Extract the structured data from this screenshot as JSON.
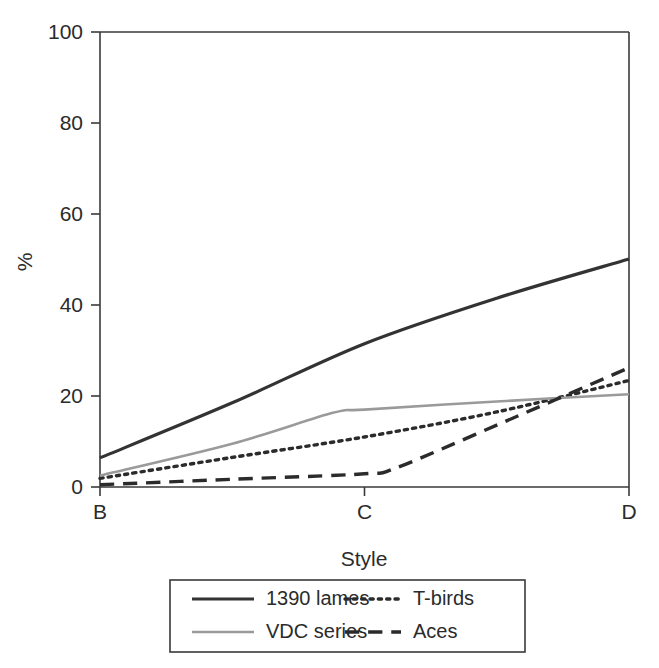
{
  "chart_data": {
    "type": "line",
    "title": "",
    "xlabel": "Style",
    "ylabel": "%",
    "categories": [
      "B",
      "C",
      "D"
    ],
    "xticklabels": [
      "B",
      "C",
      "D"
    ],
    "yticklabels": [
      "0",
      "20",
      "40",
      "60",
      "80",
      "100"
    ],
    "ytick_values": [
      0,
      20,
      40,
      60,
      80,
      100
    ],
    "ylim": [
      0,
      100
    ],
    "xlim": [
      0,
      2
    ],
    "grid": false,
    "legend_position": "below-axes",
    "series": [
      {
        "name": "1390 lames",
        "style": "solid",
        "color": "#333333",
        "width": 3.2,
        "x": [
          0,
          0.5,
          1.0,
          1.5,
          2.0
        ],
        "values": [
          6.4,
          18.5,
          31.5,
          41.5,
          50.1
        ]
      },
      {
        "name": "T-birds",
        "style": "dotted",
        "color": "#2b2b2b",
        "width": 3.4,
        "x": [
          0,
          0.5,
          1.0,
          1.5,
          2.0
        ],
        "values": [
          1.9,
          6.5,
          11.0,
          16.5,
          23.4
        ]
      },
      {
        "name": "VDC series",
        "style": "solid",
        "color": "#9a9a9a",
        "width": 2.6,
        "x": [
          0,
          0.5,
          0.88,
          1.0,
          1.5,
          2.0
        ],
        "values": [
          2.5,
          9.5,
          16.3,
          17.0,
          18.8,
          20.4
        ]
      },
      {
        "name": "Aces",
        "style": "dashed",
        "color": "#2b2b2b",
        "width": 3.4,
        "x": [
          0,
          0.5,
          1.0,
          1.12,
          1.5,
          2.0
        ],
        "values": [
          0.5,
          1.7,
          2.9,
          4.2,
          13.6,
          26.2
        ]
      }
    ],
    "legend": [
      {
        "label": "1390 lames",
        "style": "solid",
        "color": "#333333",
        "width": 3.2
      },
      {
        "label": "T-birds",
        "style": "dotted",
        "color": "#2b2b2b",
        "width": 3.4
      },
      {
        "label": "VDC series",
        "style": "solid",
        "color": "#9a9a9a",
        "width": 2.6
      },
      {
        "label": "Aces",
        "style": "dashed",
        "color": "#2b2b2b",
        "width": 3.4
      }
    ]
  },
  "axes": {
    "y_title": "%",
    "x_title": "Style"
  },
  "colors": {
    "axis": "#3a3a3a",
    "text": "#2b2b2b",
    "series_dark": "#333333",
    "series_gray": "#9a9a9a",
    "background": "#ffffff",
    "legend_border": "#3a3a3a"
  }
}
